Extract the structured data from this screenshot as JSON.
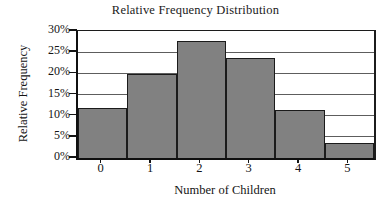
{
  "chart_data": {
    "type": "bar",
    "title": "Relative Frequency Distribution",
    "xlabel": "Number of Children",
    "ylabel": "Relative Frequency",
    "categories": [
      "0",
      "1",
      "2",
      "3",
      "4",
      "5"
    ],
    "values": [
      11.7,
      19.8,
      27.6,
      23.6,
      11.4,
      3.5
    ],
    "value_unit": "%",
    "ylim": [
      0,
      30
    ],
    "yticks": [
      0,
      5,
      10,
      15,
      20,
      25,
      30
    ],
    "ytick_labels": [
      "0%",
      "5%",
      "10%",
      "15%",
      "20%",
      "25%",
      "30%"
    ],
    "xtick_labels": [
      "0",
      "1",
      "2",
      "3",
      "4",
      "5"
    ],
    "grid": "horizontal",
    "legend": "none",
    "bar_fill_color": "#818181",
    "bar_edge_color": "#1b1b1b",
    "axis_color": "#101010",
    "gridline_color": "#5d5d5d",
    "background_color": "#ffffff"
  }
}
